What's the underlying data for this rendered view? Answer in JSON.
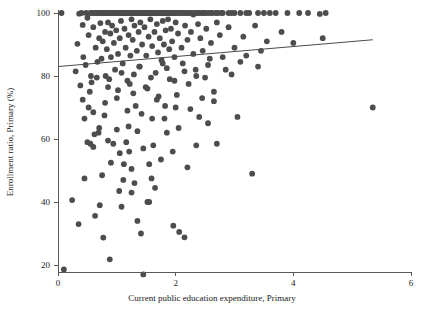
{
  "chart_data": {
    "type": "scatter",
    "title": "",
    "xlabel": "Current public education expenditure, Primary",
    "ylabel": "Enrollment ratio, Primary (%)",
    "xlim": [
      0,
      6
    ],
    "ylim": [
      14,
      102
    ],
    "xticks": [
      0,
      2,
      4,
      6
    ],
    "xticklabels": [
      "0",
      "2",
      "4",
      "6"
    ],
    "yticks": [
      20,
      40,
      60,
      80,
      100
    ],
    "yticklabels": [
      "20",
      "40",
      "60",
      "80",
      "100"
    ],
    "grid": false,
    "legend": null,
    "point_color": "#4d4d4d",
    "point_radius": 2.9,
    "trendline": {
      "type": "linear",
      "x_start": 0.0,
      "y_start": 83.0,
      "x_end": 5.35,
      "y_end": 91.5,
      "color": "#4a4a4a"
    },
    "points": [
      [
        0.06,
        100.0
      ],
      [
        0.1,
        18.6
      ],
      [
        0.24,
        40.6
      ],
      [
        0.3,
        81.5
      ],
      [
        0.33,
        90.2
      ],
      [
        0.35,
        33.0
      ],
      [
        0.36,
        99.8
      ],
      [
        0.4,
        100.0
      ],
      [
        0.42,
        96.2
      ],
      [
        0.43,
        86.0
      ],
      [
        0.45,
        47.5
      ],
      [
        0.48,
        100.0
      ],
      [
        0.5,
        98.5
      ],
      [
        0.52,
        93.0
      ],
      [
        0.54,
        75.0
      ],
      [
        0.55,
        100.0
      ],
      [
        0.56,
        80.0
      ],
      [
        0.58,
        100.0
      ],
      [
        0.6,
        95.5
      ],
      [
        0.6,
        68.5
      ],
      [
        0.62,
        100.0
      ],
      [
        0.63,
        35.6
      ],
      [
        0.64,
        89.0
      ],
      [
        0.65,
        100.0
      ],
      [
        0.66,
        79.5
      ],
      [
        0.68,
        100.0
      ],
      [
        0.69,
        62.0
      ],
      [
        0.7,
        92.0
      ],
      [
        0.7,
        100.0
      ],
      [
        0.71,
        39.0
      ],
      [
        0.72,
        96.8
      ],
      [
        0.73,
        100.0
      ],
      [
        0.74,
        85.5
      ],
      [
        0.75,
        100.0
      ],
      [
        0.76,
        91.0
      ],
      [
        0.77,
        28.7
      ],
      [
        0.78,
        100.0
      ],
      [
        0.79,
        67.5
      ],
      [
        0.8,
        100.0
      ],
      [
        0.8,
        94.0
      ],
      [
        0.81,
        80.0
      ],
      [
        0.82,
        100.0
      ],
      [
        0.83,
        88.5
      ],
      [
        0.84,
        100.0
      ],
      [
        0.85,
        97.0
      ],
      [
        0.85,
        59.5
      ],
      [
        0.86,
        100.0
      ],
      [
        0.87,
        79.0
      ],
      [
        0.88,
        100.0
      ],
      [
        0.88,
        21.8
      ],
      [
        0.89,
        93.5
      ],
      [
        0.9,
        100.0
      ],
      [
        0.9,
        86.0
      ],
      [
        0.91,
        100.0
      ],
      [
        0.92,
        96.0
      ],
      [
        0.93,
        100.0
      ],
      [
        0.94,
        58.5
      ],
      [
        0.95,
        100.0
      ],
      [
        0.95,
        90.5
      ],
      [
        0.96,
        100.0
      ],
      [
        0.97,
        82.0
      ],
      [
        0.98,
        100.0
      ],
      [
        0.99,
        94.5
      ],
      [
        1.0,
        100.0
      ],
      [
        1.0,
        73.0
      ],
      [
        1.01,
        100.0
      ],
      [
        1.02,
        87.0
      ],
      [
        1.03,
        100.0
      ],
      [
        1.04,
        43.5
      ],
      [
        1.05,
        100.0
      ],
      [
        1.05,
        92.0
      ],
      [
        1.06,
        100.0
      ],
      [
        1.07,
        97.5
      ],
      [
        1.08,
        100.0
      ],
      [
        1.08,
        38.5
      ],
      [
        1.09,
        100.0
      ],
      [
        1.1,
        84.0
      ],
      [
        1.1,
        100.0
      ],
      [
        1.11,
        47.0
      ],
      [
        1.12,
        100.0
      ],
      [
        1.13,
        95.0
      ],
      [
        1.14,
        100.0
      ],
      [
        1.15,
        89.0
      ],
      [
        1.16,
        100.0
      ],
      [
        1.16,
        59.0
      ],
      [
        1.17,
        100.0
      ],
      [
        1.18,
        78.5
      ],
      [
        1.19,
        100.0
      ],
      [
        1.2,
        93.0
      ],
      [
        1.2,
        100.0
      ],
      [
        1.21,
        56.0
      ],
      [
        1.22,
        100.0
      ],
      [
        1.23,
        86.5
      ],
      [
        1.24,
        100.0
      ],
      [
        1.25,
        98.0
      ],
      [
        1.25,
        50.5
      ],
      [
        1.26,
        100.0
      ],
      [
        1.27,
        91.5
      ],
      [
        1.28,
        100.0
      ],
      [
        1.29,
        80.5
      ],
      [
        1.3,
        100.0
      ],
      [
        1.3,
        96.0
      ],
      [
        1.31,
        100.0
      ],
      [
        1.32,
        70.5
      ],
      [
        1.33,
        100.0
      ],
      [
        1.34,
        88.0
      ],
      [
        1.35,
        100.0
      ],
      [
        1.35,
        34.0
      ],
      [
        1.36,
        100.0
      ],
      [
        1.37,
        94.0
      ],
      [
        1.38,
        100.0
      ],
      [
        1.39,
        83.0
      ],
      [
        1.4,
        100.0
      ],
      [
        1.4,
        97.0
      ],
      [
        1.41,
        30.0
      ],
      [
        1.42,
        100.0
      ],
      [
        1.43,
        90.0
      ],
      [
        1.44,
        100.0
      ],
      [
        1.45,
        17.0
      ],
      [
        1.46,
        100.0
      ],
      [
        1.47,
        95.5
      ],
      [
        1.48,
        100.0
      ],
      [
        1.49,
        76.5
      ],
      [
        1.5,
        100.0
      ],
      [
        1.5,
        86.5
      ],
      [
        1.51,
        100.0
      ],
      [
        1.52,
        40.0
      ],
      [
        1.53,
        100.0
      ],
      [
        1.54,
        92.5
      ],
      [
        1.55,
        40.0
      ],
      [
        1.56,
        100.0
      ],
      [
        1.57,
        98.0
      ],
      [
        1.58,
        100.0
      ],
      [
        1.59,
        47.5
      ],
      [
        1.6,
        100.0
      ],
      [
        1.6,
        89.5
      ],
      [
        1.61,
        100.0
      ],
      [
        1.62,
        58.0
      ],
      [
        1.63,
        100.0
      ],
      [
        1.64,
        94.0
      ],
      [
        1.65,
        100.0
      ],
      [
        1.66,
        81.0
      ],
      [
        1.67,
        100.0
      ],
      [
        1.68,
        96.5
      ],
      [
        1.69,
        100.0
      ],
      [
        1.7,
        87.5
      ],
      [
        1.7,
        100.0
      ],
      [
        1.71,
        73.5
      ],
      [
        1.72,
        100.0
      ],
      [
        1.73,
        92.0
      ],
      [
        1.74,
        100.0
      ],
      [
        1.75,
        100.0
      ],
      [
        1.76,
        85.0
      ],
      [
        1.77,
        100.0
      ],
      [
        1.78,
        97.5
      ],
      [
        1.79,
        100.0
      ],
      [
        1.8,
        90.0
      ],
      [
        1.8,
        100.0
      ],
      [
        1.81,
        66.5
      ],
      [
        1.82,
        100.0
      ],
      [
        1.83,
        94.5
      ],
      [
        1.84,
        100.0
      ],
      [
        1.85,
        82.5
      ],
      [
        1.86,
        100.0
      ],
      [
        1.87,
        98.0
      ],
      [
        1.88,
        100.0
      ],
      [
        1.89,
        88.5
      ],
      [
        1.9,
        100.0
      ],
      [
        1.9,
        79.0
      ],
      [
        1.91,
        100.0
      ],
      [
        1.92,
        95.0
      ],
      [
        1.93,
        100.0
      ],
      [
        1.94,
        91.0
      ],
      [
        1.95,
        100.0
      ],
      [
        1.96,
        32.5
      ],
      [
        1.97,
        100.0
      ],
      [
        1.98,
        86.0
      ],
      [
        1.99,
        100.0
      ],
      [
        2.0,
        97.0
      ],
      [
        2.0,
        70.0
      ],
      [
        2.02,
        100.0
      ],
      [
        2.04,
        93.5
      ],
      [
        2.05,
        100.0
      ],
      [
        2.06,
        30.5
      ],
      [
        2.08,
        100.0
      ],
      [
        2.1,
        89.0
      ],
      [
        2.1,
        100.0
      ],
      [
        2.12,
        84.0
      ],
      [
        2.14,
        100.0
      ],
      [
        2.15,
        28.8
      ],
      [
        2.16,
        96.0
      ],
      [
        2.18,
        100.0
      ],
      [
        2.2,
        91.5
      ],
      [
        2.2,
        100.0
      ],
      [
        2.22,
        77.5
      ],
      [
        2.24,
        100.0
      ],
      [
        2.26,
        94.0
      ],
      [
        2.28,
        100.0
      ],
      [
        2.3,
        87.0
      ],
      [
        2.3,
        99.5
      ],
      [
        2.32,
        100.0
      ],
      [
        2.34,
        82.0
      ],
      [
        2.36,
        100.0
      ],
      [
        2.38,
        96.5
      ],
      [
        2.4,
        100.0
      ],
      [
        2.4,
        67.0
      ],
      [
        2.42,
        92.0
      ],
      [
        2.44,
        100.0
      ],
      [
        2.46,
        88.0
      ],
      [
        2.48,
        100.0
      ],
      [
        2.5,
        100.0
      ],
      [
        2.5,
        79.5
      ],
      [
        2.52,
        95.0
      ],
      [
        2.55,
        100.0
      ],
      [
        2.58,
        85.5
      ],
      [
        2.6,
        100.0
      ],
      [
        2.6,
        90.5
      ],
      [
        2.62,
        100.0
      ],
      [
        2.65,
        75.0
      ],
      [
        2.68,
        100.0
      ],
      [
        2.7,
        97.0
      ],
      [
        2.7,
        58.5
      ],
      [
        2.72,
        100.0
      ],
      [
        2.75,
        93.0
      ],
      [
        2.78,
        100.0
      ],
      [
        2.8,
        86.0
      ],
      [
        2.8,
        100.0
      ],
      [
        2.85,
        82.0
      ],
      [
        2.9,
        100.0
      ],
      [
        2.9,
        95.5
      ],
      [
        2.95,
        100.0
      ],
      [
        3.0,
        89.0
      ],
      [
        3.0,
        100.0
      ],
      [
        3.05,
        67.0
      ],
      [
        3.1,
        100.0
      ],
      [
        3.15,
        92.5
      ],
      [
        3.2,
        100.0
      ],
      [
        3.2,
        86.5
      ],
      [
        3.25,
        100.0
      ],
      [
        3.3,
        49.0
      ],
      [
        3.35,
        96.0
      ],
      [
        3.4,
        100.0
      ],
      [
        3.45,
        88.0
      ],
      [
        3.5,
        100.0
      ],
      [
        3.55,
        91.0
      ],
      [
        3.6,
        100.0
      ],
      [
        3.7,
        100.0
      ],
      [
        3.8,
        94.0
      ],
      [
        3.9,
        100.0
      ],
      [
        4.0,
        90.5
      ],
      [
        4.1,
        100.0
      ],
      [
        4.25,
        100.0
      ],
      [
        4.45,
        99.7
      ],
      [
        4.5,
        92.0
      ],
      [
        4.55,
        100.0
      ],
      [
        5.35,
        70.0
      ],
      [
        0.45,
        66.5
      ],
      [
        0.5,
        59.0
      ],
      [
        0.55,
        58.5
      ],
      [
        0.6,
        57.5
      ],
      [
        0.62,
        61.5
      ],
      [
        0.7,
        63.5
      ],
      [
        0.75,
        48.5
      ],
      [
        0.9,
        52.5
      ],
      [
        1.0,
        63.0
      ],
      [
        1.05,
        55.5
      ],
      [
        1.12,
        52.0
      ],
      [
        1.2,
        64.0
      ],
      [
        1.25,
        43.0
      ],
      [
        1.3,
        46.0
      ],
      [
        1.35,
        62.5
      ],
      [
        1.45,
        57.0
      ],
      [
        1.55,
        52.0
      ],
      [
        1.6,
        66.5
      ],
      [
        1.65,
        44.5
      ],
      [
        1.75,
        53.5
      ],
      [
        1.85,
        62.0
      ],
      [
        1.95,
        56.0
      ],
      [
        2.05,
        63.5
      ],
      [
        2.2,
        51.0
      ],
      [
        2.35,
        58.0
      ],
      [
        2.55,
        65.0
      ],
      [
        2.65,
        72.0
      ],
      [
        0.42,
        72.5
      ],
      [
        0.52,
        70.0
      ],
      [
        0.8,
        71.5
      ],
      [
        1.02,
        75.5
      ],
      [
        1.18,
        69.0
      ],
      [
        1.28,
        74.5
      ],
      [
        1.42,
        68.0
      ],
      [
        1.52,
        76.0
      ],
      [
        1.68,
        72.5
      ],
      [
        1.82,
        70.5
      ],
      [
        2.02,
        74.0
      ],
      [
        2.25,
        69.5
      ],
      [
        2.45,
        73.0
      ],
      [
        0.38,
        77.0
      ],
      [
        0.47,
        83.5
      ],
      [
        0.57,
        78.0
      ],
      [
        0.67,
        84.5
      ],
      [
        0.85,
        76.5
      ],
      [
        1.08,
        81.0
      ],
      [
        1.22,
        77.5
      ],
      [
        1.38,
        83.0
      ],
      [
        1.58,
        79.5
      ],
      [
        1.78,
        84.0
      ],
      [
        1.98,
        78.5
      ],
      [
        2.15,
        81.5
      ],
      [
        2.35,
        80.0
      ],
      [
        2.55,
        83.5
      ],
      [
        2.95,
        80.5
      ],
      [
        3.1,
        84.5
      ],
      [
        3.4,
        83.0
      ]
    ]
  }
}
